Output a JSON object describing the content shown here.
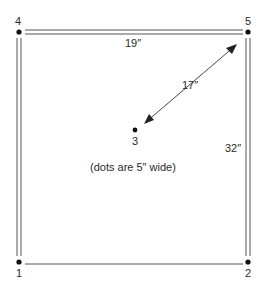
{
  "diagram": {
    "points": [
      {
        "id": "1",
        "label": "1",
        "x": 19,
        "y": 262
      },
      {
        "id": "2",
        "label": "2",
        "x": 248,
        "y": 262
      },
      {
        "id": "3",
        "label": "3",
        "x": 135,
        "y": 130
      },
      {
        "id": "4",
        "label": "4",
        "x": 19,
        "y": 32
      },
      {
        "id": "5",
        "label": "5",
        "x": 248,
        "y": 32
      }
    ],
    "dimensions": {
      "top_width": "19″",
      "diagonal": "17″",
      "right_height": "32″"
    },
    "note": "(dots are 5″ wide)",
    "colors": {
      "line": "#555555",
      "dot": "#111111",
      "bottom_gradient_start": "#6fb3a8",
      "bottom_gradient_end": "#e08a8a"
    }
  }
}
